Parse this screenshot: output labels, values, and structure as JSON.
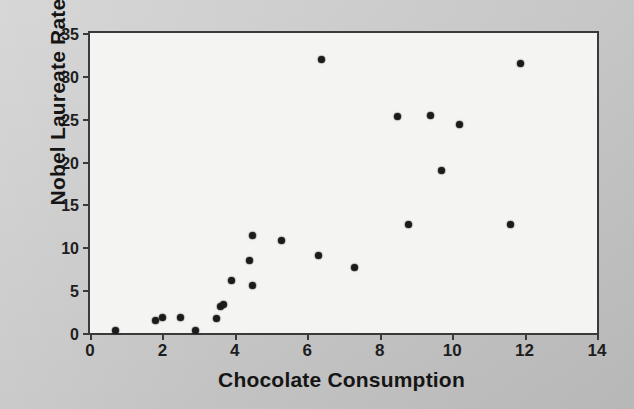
{
  "chart_data": {
    "type": "scatter",
    "title": "",
    "xlabel": "Chocolate Consumption",
    "ylabel": "Nobel Laureate Rate",
    "xlim": [
      0,
      14
    ],
    "ylim": [
      0,
      35
    ],
    "xticks": [
      0,
      2,
      4,
      6,
      8,
      10,
      12,
      14
    ],
    "yticks": [
      0,
      5,
      10,
      15,
      20,
      25,
      30,
      35
    ],
    "xtick_labels": [
      "0",
      "2",
      "4",
      "6",
      "8",
      "10",
      "12",
      "14"
    ],
    "ytick_labels": [
      "0",
      "5",
      "10",
      "15",
      "20",
      "25",
      "30",
      "35"
    ],
    "grid": false,
    "legend": "none",
    "marker": "filled-circle",
    "marker_color": "#1b1b1b",
    "plot_background": "#f4f4f2",
    "figure_background": "#c9c9c9",
    "axis_color": "#3a3a3a",
    "n_points": 23,
    "points": [
      {
        "x": 0.7,
        "y": 0.3
      },
      {
        "x": 1.8,
        "y": 1.5
      },
      {
        "x": 2.0,
        "y": 1.8
      },
      {
        "x": 2.5,
        "y": 1.8
      },
      {
        "x": 2.9,
        "y": 0.3
      },
      {
        "x": 3.5,
        "y": 1.7
      },
      {
        "x": 3.6,
        "y": 3.1
      },
      {
        "x": 3.7,
        "y": 3.3
      },
      {
        "x": 3.9,
        "y": 6.1
      },
      {
        "x": 4.4,
        "y": 8.5
      },
      {
        "x": 4.5,
        "y": 11.4
      },
      {
        "x": 4.5,
        "y": 5.5
      },
      {
        "x": 5.3,
        "y": 10.8
      },
      {
        "x": 6.3,
        "y": 9.1
      },
      {
        "x": 6.4,
        "y": 31.9
      },
      {
        "x": 7.3,
        "y": 7.7
      },
      {
        "x": 8.5,
        "y": 25.3
      },
      {
        "x": 8.8,
        "y": 12.7
      },
      {
        "x": 9.4,
        "y": 25.4
      },
      {
        "x": 9.7,
        "y": 19.0
      },
      {
        "x": 10.2,
        "y": 24.3
      },
      {
        "x": 11.6,
        "y": 12.7
      },
      {
        "x": 11.9,
        "y": 31.5
      }
    ]
  }
}
